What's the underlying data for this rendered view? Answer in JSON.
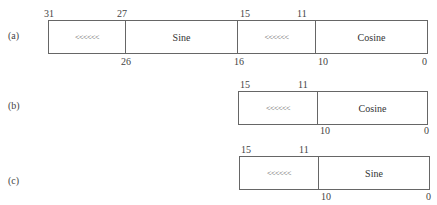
{
  "diagram": {
    "rows": [
      {
        "label": "(a)",
        "fields": [
          {
            "name": "shift",
            "text": "<<<<<<",
            "width": 76
          },
          {
            "name": "sine",
            "text": "Sine",
            "width": 112
          },
          {
            "name": "shift",
            "text": "<<<<<<",
            "width": 78
          },
          {
            "name": "cosine",
            "text": "Cosine",
            "width": 112
          }
        ],
        "top_bits": [
          "31",
          "27",
          "15",
          "11"
        ],
        "bottom_bits": [
          "26",
          "16",
          "10",
          "0"
        ]
      },
      {
        "label": "(b)",
        "fields": [
          {
            "name": "shift",
            "text": "<<<<<<",
            "width": 78
          },
          {
            "name": "cosine",
            "text": "Cosine",
            "width": 112
          }
        ],
        "top_bits": [
          "15",
          "11"
        ],
        "bottom_bits": [
          "10",
          "0"
        ]
      },
      {
        "label": "(c)",
        "fields": [
          {
            "name": "shift",
            "text": "<<<<<<",
            "width": 78
          },
          {
            "name": "sine",
            "text": "Sine",
            "width": 113
          }
        ],
        "top_bits": [
          "15",
          "11"
        ],
        "bottom_bits": [
          "10",
          "0"
        ]
      }
    ]
  }
}
